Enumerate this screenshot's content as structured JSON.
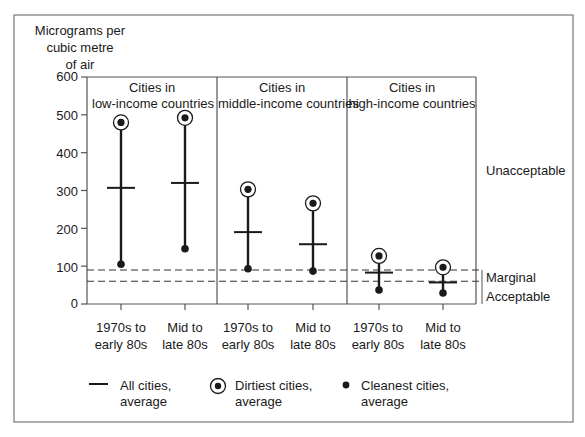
{
  "chart_data": {
    "type": "scatter",
    "title": "",
    "ylabel_lines": [
      "Micrograms per",
      "cubic metre",
      "of air"
    ],
    "xlabel": "",
    "ylim": [
      0,
      600
    ],
    "yticks": [
      0,
      100,
      200,
      300,
      400,
      500,
      600
    ],
    "grid": false,
    "panels": [
      {
        "title_lines": [
          "Cities in",
          "low-income countries"
        ],
        "categories": [
          "1970s to early 80s",
          "Mid to late 80s"
        ],
        "category_lines": [
          [
            "1970s to",
            "early 80s"
          ],
          [
            "Mid to",
            "late 80s"
          ]
        ],
        "dirtiest_avg": [
          480,
          492
        ],
        "all_avg": [
          307,
          320
        ],
        "cleanest_avg": [
          105,
          146
        ]
      },
      {
        "title_lines": [
          "Cities in",
          "middle-income countries"
        ],
        "categories": [
          "1970s to early 80s",
          "Mid to late 80s"
        ],
        "category_lines": [
          [
            "1970s to",
            "early 80s"
          ],
          [
            "Mid to",
            "late 80s"
          ]
        ],
        "dirtiest_avg": [
          303,
          266
        ],
        "all_avg": [
          190,
          158
        ],
        "cleanest_avg": [
          93,
          87
        ]
      },
      {
        "title_lines": [
          "Cities in",
          "high-income countries"
        ],
        "categories": [
          "1970s to early 80s",
          "Mid to late 80s"
        ],
        "category_lines": [
          [
            "1970s to",
            "early 80s"
          ],
          [
            "Mid to",
            "late 80s"
          ]
        ],
        "dirtiest_avg": [
          127,
          97
        ],
        "all_avg": [
          83,
          57
        ],
        "cleanest_avg": [
          37,
          29
        ]
      }
    ],
    "reference_lines": [
      {
        "value": 90,
        "style": "dashed"
      },
      {
        "value": 60,
        "style": "dashed"
      }
    ],
    "band_labels": [
      {
        "label": "Unacceptable",
        "position_value": 355
      },
      {
        "label": "Marginal",
        "position_value": 76
      },
      {
        "label": "Acceptable",
        "position_value": 20
      }
    ],
    "legend": [
      {
        "symbol": "horizontal-bar",
        "lines": [
          "All cities,",
          "average"
        ]
      },
      {
        "symbol": "circled-dot",
        "lines": [
          "Dirtiest cities,",
          "average"
        ]
      },
      {
        "symbol": "dot",
        "lines": [
          "Cleanest cities,",
          "average"
        ]
      }
    ],
    "legend_position": "bottom"
  }
}
